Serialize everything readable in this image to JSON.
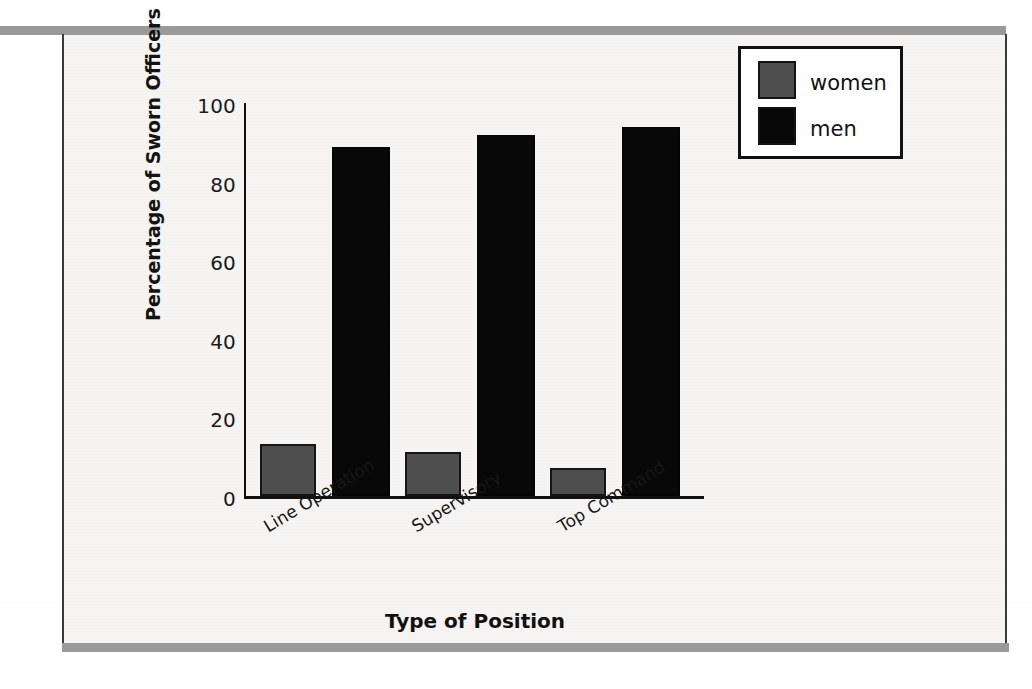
{
  "chart_data": {
    "type": "bar",
    "title": "",
    "categories": [
      "Line Operation",
      "Supervisory",
      "Top Command"
    ],
    "series": [
      {
        "name": "women",
        "values": [
          13,
          11,
          7
        ],
        "color": "#4e4e4e"
      },
      {
        "name": "men",
        "values": [
          87,
          90,
          92
        ],
        "color": "#080808"
      }
    ],
    "xlabel": "Type of Position",
    "ylabel": "Percentage of Sworn Officers by Rank",
    "ylim": [
      0,
      100
    ],
    "yticks": [
      0,
      20,
      40,
      60,
      80,
      100
    ],
    "ytick_labels": [
      "0",
      "20",
      "40",
      "60",
      "80",
      "100"
    ],
    "grid": false,
    "legend_position": "top-right",
    "xtick_rotation_deg": -31
  },
  "axis": {
    "y_label": "Percentage of Sworn Officers by Rank",
    "x_label": "Type of Position",
    "ticks": {
      "t100": "100",
      "t80": "80",
      "t60": "60",
      "t40": "40",
      "t20": "20",
      "t0": "0"
    }
  },
  "categories": {
    "c0": "Line Operation",
    "c1": "Supervisory",
    "c2": "Top Command"
  },
  "legend": {
    "entries": [
      {
        "label": "women",
        "color": "#4e4e4e"
      },
      {
        "label": "men",
        "color": "#080808"
      }
    ],
    "label_women": "women",
    "label_men": "men"
  },
  "colors": {
    "women": "#4e4e4e",
    "men": "#080808",
    "axis": "#111111",
    "paper": "#f5f4f2",
    "rule": "#9a9a9a"
  }
}
